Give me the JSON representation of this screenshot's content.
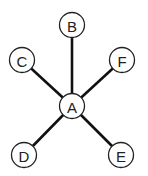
{
  "diagram": {
    "type": "star-graph",
    "center": "A",
    "nodes": [
      {
        "id": "A",
        "label": "A",
        "x": 72,
        "y": 106
      },
      {
        "id": "B",
        "label": "B",
        "x": 72,
        "y": 25
      },
      {
        "id": "C",
        "label": "C",
        "x": 22,
        "y": 60
      },
      {
        "id": "F",
        "label": "F",
        "x": 122,
        "y": 60
      },
      {
        "id": "D",
        "label": "D",
        "x": 24,
        "y": 155
      },
      {
        "id": "E",
        "label": "E",
        "x": 121,
        "y": 155
      }
    ],
    "edges": [
      {
        "from": "A",
        "to": "B"
      },
      {
        "from": "A",
        "to": "C"
      },
      {
        "from": "A",
        "to": "F"
      },
      {
        "from": "A",
        "to": "D"
      },
      {
        "from": "A",
        "to": "E"
      }
    ],
    "node_radius": 12.5,
    "colors": {
      "edge": "#111111",
      "node_stroke": "#222222",
      "node_fill": "#ffffff",
      "label": "#222222"
    }
  }
}
